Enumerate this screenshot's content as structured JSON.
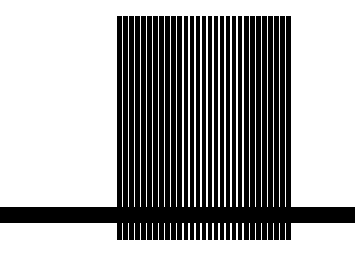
{
  "figure": {
    "stripes": {
      "count": 29,
      "color": "#000000",
      "background": "#ffffff"
    },
    "horizontal_bar": {
      "color": "#000000"
    }
  }
}
